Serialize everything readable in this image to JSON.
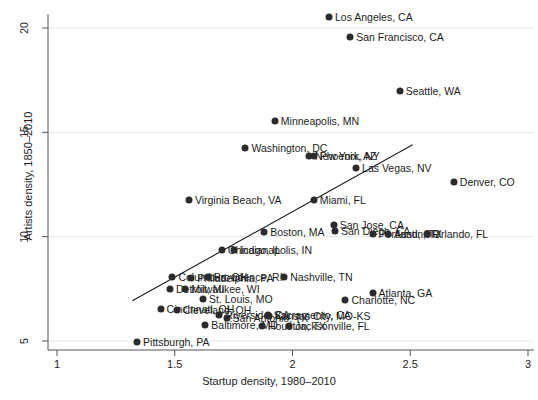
{
  "chart_data": {
    "type": "scatter",
    "title": "",
    "xlabel": "Startup density, 1980–2010",
    "ylabel": "Artists density, 1850–2010",
    "xlim": [
      1,
      3
    ],
    "ylim": [
      4.2,
      20.9
    ],
    "xticks": [
      "1",
      "1.5",
      "2",
      "2.5",
      "3"
    ],
    "xtickvals": [
      1,
      1.5,
      2,
      2.5,
      3
    ],
    "yticks": [
      "5",
      "10",
      "15",
      "20"
    ],
    "ytickvals": [
      5,
      10,
      15,
      20
    ],
    "grid": "horizontal",
    "legend": "none",
    "marker_color": "#2b2b2b",
    "trendline": {
      "x0": 1.32,
      "y0": 6.93,
      "x1": 2.51,
      "y1": 14.4
    },
    "points": [
      {
        "label": "Los Angeles, CA",
        "x": 2.155,
        "y": 20.55
      },
      {
        "label": "San Francisco, CA",
        "x": 2.245,
        "y": 19.55
      },
      {
        "label": "Seattle, WA",
        "x": 2.455,
        "y": 17.0
      },
      {
        "label": "Minneapolis, MN",
        "x": 1.925,
        "y": 15.55
      },
      {
        "label": "Washington, DC",
        "x": 1.8,
        "y": 14.25
      },
      {
        "label": "New York, NY",
        "x": 2.07,
        "y": 13.85
      },
      {
        "label": "Phoenix, AZ",
        "x": 2.09,
        "y": 13.85
      },
      {
        "label": "Las Vegas, NV",
        "x": 2.27,
        "y": 13.3
      },
      {
        "label": "Denver, CO",
        "x": 2.685,
        "y": 12.6
      },
      {
        "label": "Virginia Beach, VA",
        "x": 1.56,
        "y": 11.75
      },
      {
        "label": "Miami, FL",
        "x": 2.09,
        "y": 11.75
      },
      {
        "label": "San Jose, CA",
        "x": 2.175,
        "y": 10.55
      },
      {
        "label": "San Diego, CA",
        "x": 2.18,
        "y": 10.25
      },
      {
        "label": "Boston, MA",
        "x": 1.88,
        "y": 10.2
      },
      {
        "label": "Portland, OR",
        "x": 2.34,
        "y": 10.15
      },
      {
        "label": "Austin, TX",
        "x": 2.405,
        "y": 10.15
      },
      {
        "label": "Orlando, FL",
        "x": 2.57,
        "y": 10.15
      },
      {
        "label": "Chicago, IL",
        "x": 1.7,
        "y": 9.35
      },
      {
        "label": "Indianapolis, IN",
        "x": 1.75,
        "y": 9.35
      },
      {
        "label": "Columbus, OH",
        "x": 1.49,
        "y": 8.05
      },
      {
        "label": "Philadelphia, PA",
        "x": 1.57,
        "y": 8.0
      },
      {
        "label": "Providence, RI",
        "x": 1.64,
        "y": 8.05
      },
      {
        "label": "Nashville, TN",
        "x": 1.965,
        "y": 8.05
      },
      {
        "label": "Detroit, MI",
        "x": 1.48,
        "y": 7.5
      },
      {
        "label": "Milwaukee, WI",
        "x": 1.545,
        "y": 7.5
      },
      {
        "label": "St. Louis, MO",
        "x": 1.62,
        "y": 7.0
      },
      {
        "label": "Atlanta, GA",
        "x": 2.34,
        "y": 7.3
      },
      {
        "label": "Charlotte, NC",
        "x": 2.225,
        "y": 6.95
      },
      {
        "label": "Cincinnati, OH",
        "x": 1.44,
        "y": 6.55
      },
      {
        "label": "Cleveland, OH",
        "x": 1.51,
        "y": 6.5
      },
      {
        "label": "Riverside, CA",
        "x": 1.69,
        "y": 6.25
      },
      {
        "label": "San Antonio, TX",
        "x": 1.72,
        "y": 6.1
      },
      {
        "label": "Kansas City, MO-KS",
        "x": 1.9,
        "y": 6.2
      },
      {
        "label": "Sacramento, CA",
        "x": 1.895,
        "y": 6.25
      },
      {
        "label": "Baltimore, MD",
        "x": 1.63,
        "y": 5.75
      },
      {
        "label": "Houston, TX",
        "x": 1.87,
        "y": 5.7
      },
      {
        "label": "Jacksonville, FL",
        "x": 1.985,
        "y": 5.7
      },
      {
        "label": "Pittsburgh, PA",
        "x": 1.34,
        "y": 4.95
      }
    ]
  }
}
